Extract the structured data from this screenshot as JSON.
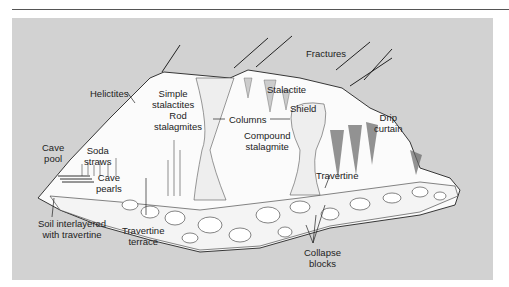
{
  "diagram": {
    "type": "cross-section illustration",
    "colors": {
      "panel_bg": "#d2d2d2",
      "cave_fill": "#ffffff",
      "line": "#222222",
      "rule": "#555555"
    },
    "labels": {
      "fractures": "Fractures",
      "stalactite": "Stalactite",
      "helictites": "Helictites",
      "simple_stalactites": "Simple\nstalactites",
      "rod_stalagmites": "Rod\nstalagmites",
      "columns": "Columns",
      "shield": "Shield",
      "drip_curtain": "Drip\ncurtain",
      "compound_stalagmite": "Compound\nstalagmite",
      "cave_pool": "Cave\npool",
      "soda_straws": "Soda\nstraws",
      "cave_pearls": "Cave\npearls",
      "travertine": "Travertine",
      "soil_interlayered": "Soil interlayered\nwith travertine",
      "travertine_terrace": "Travertine\nterrace",
      "collapse_blocks": "Collapse\nblocks"
    }
  }
}
